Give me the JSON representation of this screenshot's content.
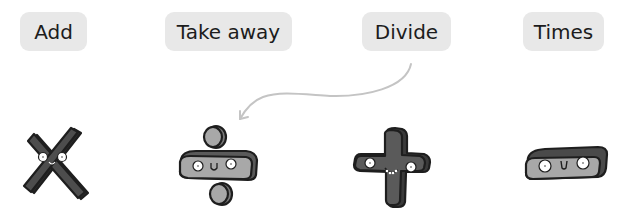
{
  "labels": [
    {
      "id": "add",
      "text": "Add"
    },
    {
      "id": "take_away",
      "text": "Take away"
    },
    {
      "id": "divide",
      "text": "Divide"
    },
    {
      "id": "times",
      "text": "Times"
    }
  ],
  "characters": [
    {
      "symbol": "times-sign",
      "description": "multiplication sign character with face"
    },
    {
      "symbol": "division-sign",
      "description": "division sign character with face"
    },
    {
      "symbol": "plus-sign",
      "description": "plus sign character with smiling face"
    },
    {
      "symbol": "minus-sign",
      "description": "minus sign character with face"
    }
  ],
  "arrow": {
    "from": "Divide",
    "to": "division-sign",
    "color": "#c4c4c4"
  },
  "colors": {
    "label_bg": "#e8e8e8",
    "dark_char": "#4a4a4a",
    "light_char": "#a8a8a8",
    "outline": "#1e1e1e"
  }
}
